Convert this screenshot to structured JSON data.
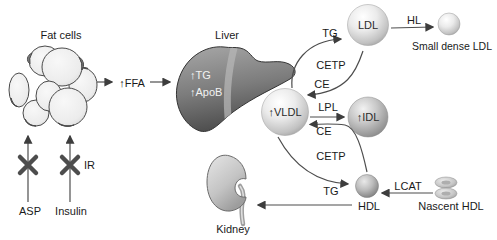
{
  "figure": {
    "labels": {
      "fat_cells": "Fat cells",
      "asp": "ASP",
      "insulin": "Insulin",
      "ir": "IR",
      "ffa": "↑FFA",
      "liver": "Liver",
      "liver_tg": "↑TG",
      "liver_apob": "↑ApoB",
      "vldl": "↑VLDL",
      "ldl": "LDL",
      "idl": "↑IDL",
      "hdl": "HDL",
      "hl": "HL",
      "small_dense_ldl": "Small dense LDL",
      "tg_vldl_to_ldl": "TG",
      "cetp_upper": "CETP",
      "ce_ldl_to_vldl": "CE",
      "lpl": "LPL",
      "ce_hdl_to_vldl": "CE",
      "cetp_lower": "CETP",
      "tg_vldl_to_hdl": "TG",
      "lcat": "LCAT",
      "nascent_hdl": "Nascent HDL",
      "kidney": "Kidney"
    },
    "colors": {
      "background": "#ffffff",
      "text": "#1a1a1a",
      "arrow": "#3d3d3d",
      "block_x": "#4d4d4d",
      "liver_top": "#a8a8a8",
      "liver_bottom": "#4e4e4e",
      "sphere_highlight": "#ffffff",
      "sphere_edge": "#a0a0a0",
      "idl_edge": "#8a8a8a",
      "hdl_edge": "#7f7f7f"
    }
  }
}
